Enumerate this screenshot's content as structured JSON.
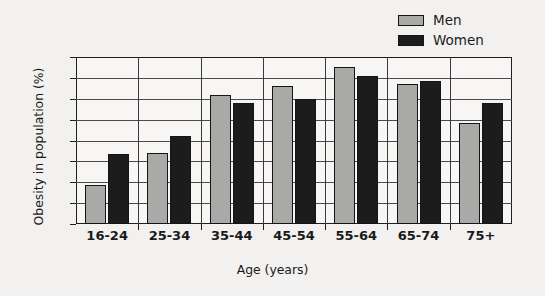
{
  "chart_data": {
    "type": "bar",
    "title": "",
    "xlabel": "Age (years)",
    "ylabel": "Obesity in population (%)",
    "categories": [
      "16-24",
      "25-34",
      "35-44",
      "45-54",
      "55-64",
      "65-74",
      "75+"
    ],
    "series": [
      {
        "name": "Men",
        "color": "#a9a9a7",
        "values": [
          9.3,
          17.0,
          31.0,
          33.0,
          37.5,
          33.5,
          24.3
        ]
      },
      {
        "name": "Women",
        "color": "#1c1c1c",
        "values": [
          16.8,
          21.0,
          29.0,
          30.0,
          35.5,
          34.3,
          29.0
        ]
      }
    ],
    "ylim": [
      0,
      40
    ],
    "ytick_values": [
      0,
      5,
      10,
      15,
      20,
      25,
      30,
      35,
      40
    ],
    "ytick_labels": [
      "0",
      "5",
      "10",
      "15",
      "20",
      "25",
      "30",
      "35",
      "40"
    ],
    "grid": true,
    "legend_position": "top-right"
  },
  "legend": {
    "items": [
      {
        "label": "Men"
      },
      {
        "label": "Women"
      }
    ]
  }
}
